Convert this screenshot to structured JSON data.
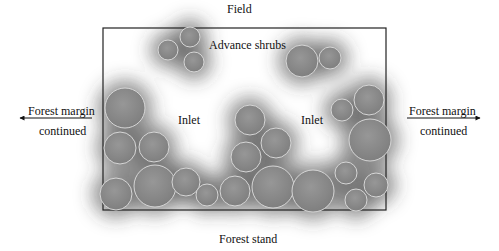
{
  "title_top": "Field",
  "title_bottom": "Forest stand",
  "labels": {
    "advance_shrubs": "Advance shrubs",
    "inlet_left": "Inlet",
    "inlet_right": "Inlet",
    "margin_left_line1": "Forest margin",
    "margin_left_line2": "continued",
    "margin_right_line1": "Forest margin",
    "margin_right_line2": "continued"
  },
  "colors": {
    "circle_fill": "#8c8c8c",
    "circle_stroke": "#d6d6d6",
    "shadow": "#3a3a3a",
    "box_stroke": "#222222",
    "background": "#ffffff"
  },
  "plot_box": {
    "x": 103,
    "y": 28,
    "width": 283,
    "height": 182
  },
  "arrows": [
    {
      "name": "left",
      "x1": 92,
      "y1": 118,
      "x2": 20,
      "y2": 118
    },
    {
      "name": "right",
      "x1": 407,
      "y1": 118,
      "x2": 480,
      "y2": 118
    }
  ],
  "shrubs": [
    {
      "cx": 168,
      "cy": 50,
      "r": 10
    },
    {
      "cx": 190,
      "cy": 37,
      "r": 10
    },
    {
      "cx": 194,
      "cy": 62,
      "r": 10
    },
    {
      "cx": 302,
      "cy": 61,
      "r": 16
    },
    {
      "cx": 330,
      "cy": 58,
      "r": 11
    },
    {
      "cx": 125,
      "cy": 108,
      "r": 20
    },
    {
      "cx": 120,
      "cy": 148,
      "r": 16
    },
    {
      "cx": 154,
      "cy": 147,
      "r": 15
    },
    {
      "cx": 116,
      "cy": 194,
      "r": 16
    },
    {
      "cx": 155,
      "cy": 186,
      "r": 21
    },
    {
      "cx": 186,
      "cy": 182,
      "r": 14
    },
    {
      "cx": 207,
      "cy": 195,
      "r": 11
    },
    {
      "cx": 235,
      "cy": 191,
      "r": 15
    },
    {
      "cx": 250,
      "cy": 120,
      "r": 15
    },
    {
      "cx": 246,
      "cy": 157,
      "r": 15
    },
    {
      "cx": 276,
      "cy": 143,
      "r": 15
    },
    {
      "cx": 273,
      "cy": 187,
      "r": 21
    },
    {
      "cx": 313,
      "cy": 191,
      "r": 21
    },
    {
      "cx": 342,
      "cy": 110,
      "r": 11
    },
    {
      "cx": 369,
      "cy": 100,
      "r": 15
    },
    {
      "cx": 370,
      "cy": 140,
      "r": 21
    },
    {
      "cx": 346,
      "cy": 173,
      "r": 11
    },
    {
      "cx": 376,
      "cy": 185,
      "r": 12
    },
    {
      "cx": 356,
      "cy": 200,
      "r": 11
    }
  ]
}
